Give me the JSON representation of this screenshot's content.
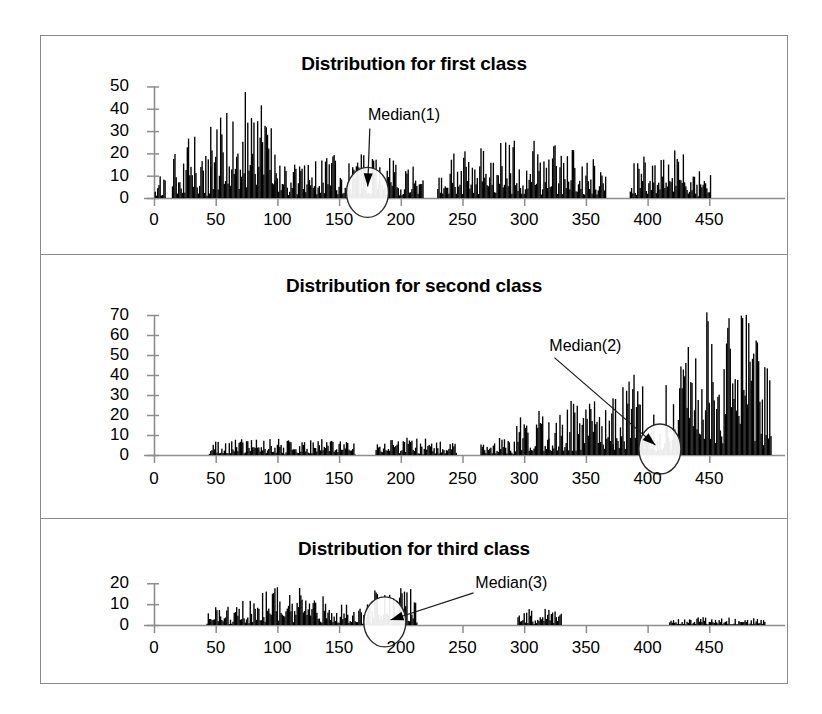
{
  "figure": {
    "width": 822,
    "height": 714,
    "background": "#ffffff",
    "frame_color": "#8a8a8a",
    "bar_color": "#000000",
    "axis_color": "#808080"
  },
  "chart_data": [
    {
      "type": "bar",
      "title": "Distribution for first class",
      "xlabel": "",
      "ylabel": "",
      "xlim": [
        0,
        500
      ],
      "ylim": [
        0,
        52
      ],
      "grid": false,
      "legend": "none",
      "xticks": [
        0,
        50,
        100,
        150,
        200,
        250,
        300,
        350,
        400,
        450
      ],
      "xtick_labels": [
        "0",
        "50",
        "100",
        "150",
        "200",
        "250",
        "300",
        "350",
        "400",
        "450"
      ],
      "yticks": [
        0,
        10,
        20,
        30,
        40,
        50
      ],
      "ytick_labels": [
        "0",
        "10",
        "20",
        "30",
        "40",
        "50"
      ],
      "annotation": {
        "text": "Median(1)",
        "label_x": 175,
        "label_y": 33,
        "target_x": 173,
        "target_y": 2.5,
        "marker": "ellipse-with-arrow"
      },
      "segments": [
        {
          "x_start": 1,
          "x_end": 9,
          "mean": 6,
          "peak": 12,
          "seed": 11
        },
        {
          "x_start": 15,
          "x_end": 46,
          "mean": 11,
          "peak": 28,
          "seed": 12
        },
        {
          "x_start": 46,
          "x_end": 98,
          "mean": 22,
          "peak": 48,
          "seed": 13
        },
        {
          "x_start": 98,
          "x_end": 218,
          "mean": 9,
          "peak": 20,
          "seed": 14
        },
        {
          "x_start": 230,
          "x_end": 366,
          "mean": 9,
          "peak": 26,
          "seed": 15
        },
        {
          "x_start": 386,
          "x_end": 451,
          "mean": 9,
          "peak": 23,
          "seed": 16
        }
      ],
      "notes": "Dense single-unit spikes; tallest spikes ~48 near x=55-90; long low plateau ~5-20 after x=100; gaps at 9-15, 218-230, 366-386; data ends at x=451."
    },
    {
      "type": "bar",
      "title": "Distribution for second class",
      "xlabel": "",
      "ylabel": "",
      "xlim": [
        0,
        500
      ],
      "ylim": [
        0,
        78
      ],
      "grid": false,
      "legend": "none",
      "xticks": [
        0,
        50,
        100,
        150,
        200,
        250,
        300,
        350,
        400,
        450
      ],
      "xtick_labels": [
        "0",
        "50",
        "100",
        "150",
        "200",
        "250",
        "300",
        "350",
        "400",
        "450"
      ],
      "yticks": [
        0,
        10,
        20,
        30,
        40,
        50,
        60,
        70
      ],
      "ytick_labels": [
        "0",
        "10",
        "20",
        "30",
        "40",
        "50",
        "60",
        "70"
      ],
      "annotation": {
        "text": "Median(2)",
        "label_x": 322,
        "label_y": 50,
        "target_x": 410,
        "target_y": 3.0,
        "marker": "ellipse-with-arrow"
      },
      "segments": [
        {
          "x_start": 45,
          "x_end": 163,
          "mean": 4,
          "peak": 9,
          "seed": 21
        },
        {
          "x_start": 180,
          "x_end": 245,
          "mean": 4,
          "peak": 9,
          "seed": 22
        },
        {
          "x_start": 265,
          "x_end": 292,
          "mean": 4,
          "peak": 9,
          "seed": 23
        },
        {
          "x_start": 292,
          "x_end": 320,
          "mean": 11,
          "peak": 25,
          "seed": 24
        },
        {
          "x_start": 320,
          "x_end": 372,
          "mean": 12,
          "peak": 29,
          "seed": 25
        },
        {
          "x_start": 372,
          "x_end": 425,
          "mean": 14,
          "peak": 45,
          "seed": 26
        },
        {
          "x_start": 425,
          "x_end": 500,
          "mean": 28,
          "peak": 76,
          "seed": 27
        }
      ],
      "notes": "Low flat band ~0-9 from x=45 to x=245; rising from x=290; strong tall spikes up to ~76 between x=440 and x=500; gaps at 163-180 and 245-265."
    },
    {
      "type": "bar",
      "title": "Distribution for third class",
      "xlabel": "",
      "ylabel": "",
      "xlim": [
        0,
        500
      ],
      "ylim": [
        0,
        23
      ],
      "grid": false,
      "legend": "none",
      "xticks": [
        0,
        50,
        100,
        150,
        200,
        250,
        300,
        350,
        400,
        450
      ],
      "xtick_labels": [
        "0",
        "50",
        "100",
        "150",
        "200",
        "250",
        "300",
        "350",
        "400",
        "450"
      ],
      "yticks": [
        0,
        10,
        20
      ],
      "ytick_labels": [
        "0",
        "10",
        "20"
      ],
      "annotation": {
        "text": "Median(3)",
        "label_x": 262,
        "label_y": 16,
        "target_x": 187,
        "target_y": 1.5,
        "marker": "ellipse-with-arrow"
      },
      "segments": [
        {
          "x_start": 43,
          "x_end": 66,
          "mean": 4,
          "peak": 10,
          "seed": 31
        },
        {
          "x_start": 66,
          "x_end": 140,
          "mean": 7,
          "peak": 19,
          "seed": 32
        },
        {
          "x_start": 140,
          "x_end": 170,
          "mean": 5,
          "peak": 13,
          "seed": 33
        },
        {
          "x_start": 170,
          "x_end": 196,
          "mean": 6,
          "peak": 18,
          "seed": 34
        },
        {
          "x_start": 196,
          "x_end": 213,
          "mean": 9,
          "peak": 20,
          "seed": 35
        },
        {
          "x_start": 295,
          "x_end": 330,
          "mean": 4,
          "peak": 8,
          "seed": 36
        },
        {
          "x_start": 418,
          "x_end": 495,
          "mean": 1.6,
          "peak": 4,
          "seed": 37
        }
      ],
      "notes": "Main body x=43-213 peaking near 20; isolated block x=295-330 up to ~8; very low sparse tail x=418-495 under 4; gaps at 213-295 and 330-418."
    }
  ]
}
